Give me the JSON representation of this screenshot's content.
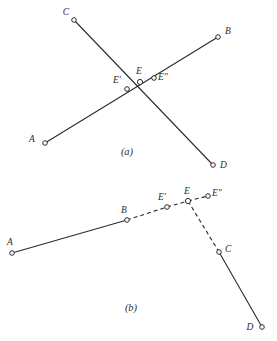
{
  "document": {
    "title": "Geometric line intersection figures",
    "background_color": "#ffffff",
    "ink_color": "#2b2b2b",
    "width": 277,
    "height": 341
  },
  "figures": [
    {
      "id": "figure-a",
      "caption": "(a)",
      "caption_pos": {
        "x": 127,
        "y": 155
      },
      "description": "Two straight lines AB and CD crossing near the middle, with points E', E and E'' marked near the intersection.",
      "points": [
        {
          "name": "C",
          "label": "C",
          "x": 74,
          "y": 20,
          "label_x": 66,
          "label_y": 15
        },
        {
          "name": "B",
          "label": "B",
          "x": 218,
          "y": 37,
          "label_x": 225,
          "label_y": 34
        },
        {
          "name": "A",
          "label": "A",
          "x": 45,
          "y": 143,
          "label_x": 32,
          "label_y": 142
        },
        {
          "name": "D",
          "label": "D",
          "x": 213,
          "y": 165,
          "label_x": 220,
          "label_y": 168
        },
        {
          "name": "Eprime",
          "label": "E′",
          "x": 127,
          "y": 89,
          "label_x": 117,
          "label_y": 83
        },
        {
          "name": "E",
          "label": "E",
          "x": 140,
          "y": 82,
          "label_x": 139,
          "label_y": 74
        },
        {
          "name": "Edprime",
          "label": "E″",
          "x": 154,
          "y": 78,
          "label_x": 158,
          "label_y": 80
        }
      ],
      "segments": [
        {
          "name": "line-A-B",
          "from": "A",
          "to": "B",
          "style": "solid"
        },
        {
          "name": "line-C-D",
          "from": "C",
          "to": "D",
          "style": "solid"
        }
      ]
    },
    {
      "id": "figure-b",
      "caption": "(b)",
      "caption_pos": {
        "x": 131,
        "y": 311
      },
      "description": "Broken path: solid segment A to B, dashed B to E' to E, short dashed E to E'', dashed E down to C, solid C to D.",
      "points": [
        {
          "name": "A",
          "label": "A",
          "x": 12,
          "y": 253,
          "label_x": 10,
          "label_y": 245
        },
        {
          "name": "B",
          "label": "B",
          "x": 127,
          "y": 220,
          "label_x": 124,
          "label_y": 213
        },
        {
          "name": "Eprime",
          "label": "E′",
          "x": 167,
          "y": 207,
          "label_x": 162,
          "label_y": 200
        },
        {
          "name": "E",
          "label": "E",
          "x": 188,
          "y": 201,
          "label_x": 187,
          "label_y": 194
        },
        {
          "name": "Edprime",
          "label": "E″",
          "x": 208,
          "y": 196,
          "label_x": 212,
          "label_y": 196
        },
        {
          "name": "C",
          "label": "C",
          "x": 219,
          "y": 252,
          "label_x": 225,
          "label_y": 252
        },
        {
          "name": "D",
          "label": "D",
          "x": 262,
          "y": 327,
          "label_x": 250,
          "label_y": 330
        }
      ],
      "segments": [
        {
          "name": "line-A-B",
          "from": "A",
          "to": "B",
          "style": "solid"
        },
        {
          "name": "line-B-Eprime",
          "from": "B",
          "to": "Eprime",
          "style": "dashed"
        },
        {
          "name": "line-Eprime-E",
          "from": "Eprime",
          "to": "E",
          "style": "dashed"
        },
        {
          "name": "line-E-Edprime",
          "from": "E",
          "to": "Edprime",
          "style": "dashed"
        },
        {
          "name": "line-E-C",
          "from": "E",
          "to": "C",
          "style": "dashed"
        },
        {
          "name": "line-C-D",
          "from": "C",
          "to": "D",
          "style": "solid"
        }
      ]
    }
  ]
}
